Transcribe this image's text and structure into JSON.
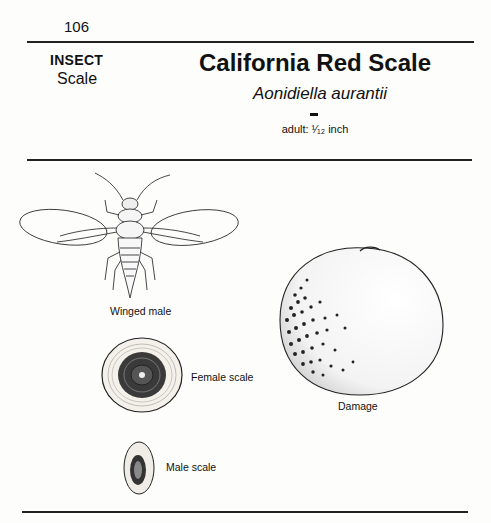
{
  "page": {
    "number": "106"
  },
  "header": {
    "category": "INSECT",
    "subcategory": "Scale",
    "common_name": "California Red Scale",
    "scientific_name": "Aonidiella aurantii",
    "size_label": "adult: ¹⁄₁₂ inch"
  },
  "figures": [
    {
      "id": "winged-male",
      "caption": "Winged male"
    },
    {
      "id": "female-scale",
      "caption": "Female scale"
    },
    {
      "id": "male-scale",
      "caption": "Male scale"
    },
    {
      "id": "damage",
      "caption": "Damage"
    }
  ]
}
